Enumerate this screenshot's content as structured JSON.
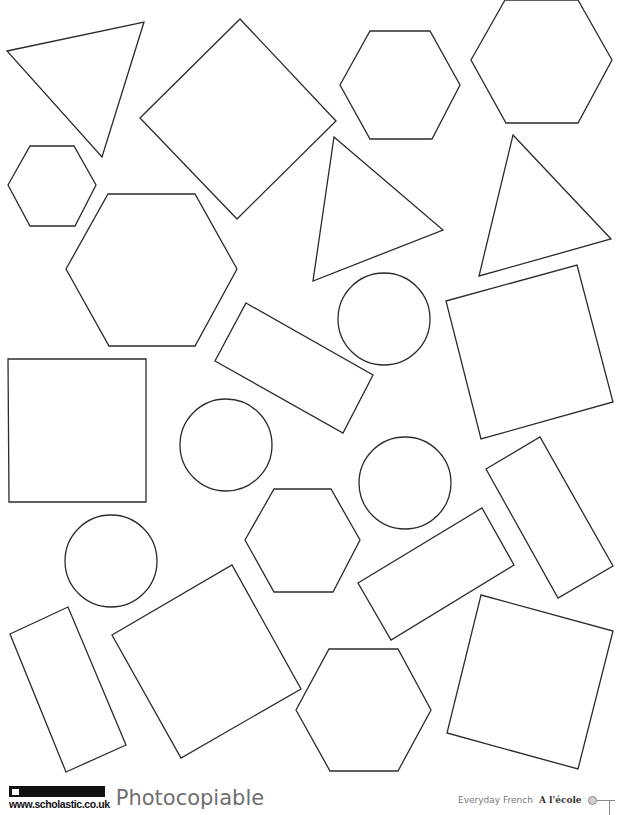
{
  "worksheet": {
    "shapes": [
      {
        "type": "triangle",
        "name": "triangle-top-left",
        "points": "7,51 144,22 102,157"
      },
      {
        "type": "square",
        "name": "square-rotated-top",
        "points": "140,118 240,19 336,121 237,219"
      },
      {
        "type": "hexagon",
        "name": "hexagon-top-middle",
        "points": "340,85 370,31 430,31 460,85 432,139 370,139"
      },
      {
        "type": "hexagon",
        "name": "hexagon-top-right",
        "points": "471,60 505,0 578,0 612,60 578,123 506,123"
      },
      {
        "type": "hexagon",
        "name": "hexagon-small-left",
        "points": "8,185 30,146 74,146 96,185 75,226 30,226"
      },
      {
        "type": "hexagon",
        "name": "hexagon-large-left",
        "points": "66,269 108,194 195,194 237,269 195,346 109,346"
      },
      {
        "type": "triangle",
        "name": "triangle-middle",
        "points": "334,137 443,230 313,281"
      },
      {
        "type": "triangle",
        "name": "triangle-right",
        "points": "513,135 611,239 479,276"
      },
      {
        "type": "circle",
        "name": "circle-upper-middle",
        "cx": 384,
        "cy": 319,
        "r": 46
      },
      {
        "type": "rectangle",
        "name": "rectangle-tilted-middle",
        "points": "246,303 373,375 343,433 215,361"
      },
      {
        "type": "square",
        "name": "square-right-upper",
        "points": "446,301 577,265 613,402 481,439"
      },
      {
        "type": "square",
        "name": "square-left",
        "points": "8,359 146,359 146,502 9,502"
      },
      {
        "type": "circle",
        "name": "circle-middle-left",
        "cx": 226,
        "cy": 445,
        "r": 46
      },
      {
        "type": "circle",
        "name": "circle-middle-right",
        "cx": 405,
        "cy": 483,
        "r": 46
      },
      {
        "type": "rectangle",
        "name": "rectangle-right-vertical",
        "points": "486,469 540,437 613,566 558,598"
      },
      {
        "type": "circle",
        "name": "circle-lower-left",
        "cx": 111,
        "cy": 561,
        "r": 46
      },
      {
        "type": "hexagon",
        "name": "hexagon-center",
        "points": "245,540 274,489 331,489 360,540 333,592 274,592"
      },
      {
        "type": "rectangle",
        "name": "rectangle-tilted-lower",
        "points": "358,583 482,508 514,565 391,640"
      },
      {
        "type": "rectangle",
        "name": "rectangle-lower-left",
        "points": "10,634 68,607 126,745 66,772"
      },
      {
        "type": "square",
        "name": "square-rotated-lower",
        "points": "112,635 232,565 301,689 181,758"
      },
      {
        "type": "hexagon",
        "name": "hexagon-bottom",
        "points": "296,710 329,649 398,649 431,710 398,771 330,771"
      },
      {
        "type": "square",
        "name": "square-rotated-bottom-right",
        "points": "481,595 613,631 578,769 447,733"
      }
    ]
  },
  "footer": {
    "brand_badge": "SCHOLASTIC",
    "brand_url": "www.scholastic.co.uk",
    "photocopiable": "Photocopiable",
    "series": "Everyday French",
    "topic": "A l'école"
  },
  "colors": {
    "stroke": "#2b2b2b",
    "footer_gray": "#6f6f6f",
    "badge_bg": "#111111"
  }
}
